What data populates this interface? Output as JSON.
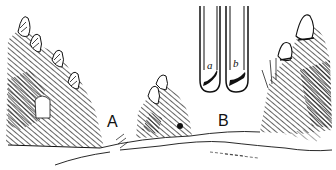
{
  "illustration": {
    "description": "Line-drawing of two test tubes above a landscape with rock/plant formations",
    "labels": {
      "region_a": "A",
      "region_b": "B",
      "tube_a": "a",
      "tube_b": "b"
    },
    "colors": {
      "ink": "#111111",
      "paper": "#ffffff"
    }
  }
}
